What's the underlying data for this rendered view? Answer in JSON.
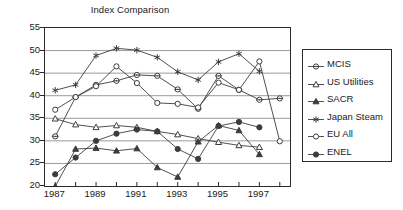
{
  "chart_data": {
    "type": "line",
    "title": "Index Comparison",
    "xlabel": "",
    "ylabel": "",
    "x": [
      1987,
      1988,
      1989,
      1990,
      1991,
      1992,
      1993,
      1994,
      1995,
      1996,
      1997,
      1998
    ],
    "xlim": [
      1986.5,
      1998.5
    ],
    "ylim": [
      20,
      55
    ],
    "yticks": [
      20,
      25,
      30,
      35,
      40,
      45,
      50,
      55
    ],
    "xticks": [
      1987,
      1988,
      1989,
      1990,
      1991,
      1992,
      1993,
      1994,
      1995,
      1996,
      1997,
      1998
    ],
    "xtick_labels": [
      "1987",
      "",
      "1989",
      "",
      "1991",
      "",
      "1993",
      "",
      "1995",
      "",
      "1997",
      ""
    ],
    "grid": "horizontal",
    "legend_position": "right",
    "series": [
      {
        "name": "MCIS",
        "marker": "circle-dot",
        "fill": "open",
        "values": [
          31.0,
          39.7,
          42.4,
          43.3,
          44.6,
          44.4,
          41.4,
          37.1,
          44.4,
          41.3,
          39.1,
          39.4
        ]
      },
      {
        "name": "US Utilities",
        "marker": "triangle",
        "fill": "open",
        "values": [
          34.9,
          33.6,
          33.0,
          33.4,
          33.0,
          32.1,
          31.4,
          30.5,
          29.7,
          29.0,
          28.6,
          null
        ]
      },
      {
        "name": "SACR",
        "marker": "triangle",
        "fill": "filled",
        "values": [
          19.9,
          28.2,
          28.4,
          27.8,
          28.3,
          24.1,
          22.0,
          29.8,
          33.4,
          32.3,
          27.0,
          null
        ]
      },
      {
        "name": "Japan Steam",
        "marker": "asterisk",
        "fill": "open",
        "values": [
          41.2,
          42.4,
          48.9,
          50.5,
          50.1,
          48.5,
          45.3,
          43.5,
          47.5,
          49.3,
          45.4,
          null
        ]
      },
      {
        "name": "EU All",
        "marker": "circle",
        "fill": "open",
        "values": [
          36.9,
          39.7,
          42.1,
          46.5,
          42.8,
          38.4,
          38.2,
          37.4,
          42.9,
          41.3,
          47.6,
          29.9
        ]
      },
      {
        "name": "ENEL",
        "marker": "circle",
        "fill": "filled",
        "values": [
          22.6,
          26.3,
          30.0,
          31.6,
          32.5,
          32.1,
          28.2,
          26.0,
          33.3,
          34.2,
          33.0,
          null
        ]
      }
    ]
  },
  "legend": {
    "items": [
      {
        "label": "MCIS"
      },
      {
        "label": "US Utilities"
      },
      {
        "label": "SACR"
      },
      {
        "label": "Japan Steam"
      },
      {
        "label": "EU All"
      },
      {
        "label": "ENEL"
      }
    ]
  },
  "colors": {
    "axis": "#2b2b2b",
    "grid": "#9a9a9a",
    "line": "#3c3c3c",
    "text": "#1a1a1a",
    "background": "#ffffff"
  }
}
